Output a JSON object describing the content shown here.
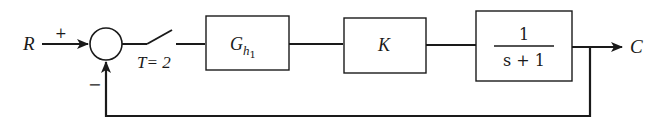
{
  "diagram": {
    "type": "closed-loop sampled-data control system block diagram",
    "input_label": "R",
    "output_label": "C",
    "summing_junction": {
      "plus_sign": "+",
      "minus_sign": "−"
    },
    "sampler": {
      "label": "T= 2"
    },
    "blocks": [
      {
        "id": "zoh",
        "label_main": "G",
        "label_sub": "h",
        "label_subsub": "1"
      },
      {
        "id": "gain",
        "label_main": "K"
      },
      {
        "id": "plant",
        "numerator": "1",
        "denominator": "s + 1"
      }
    ],
    "feedback": "unity negative feedback from C to summing junction"
  }
}
